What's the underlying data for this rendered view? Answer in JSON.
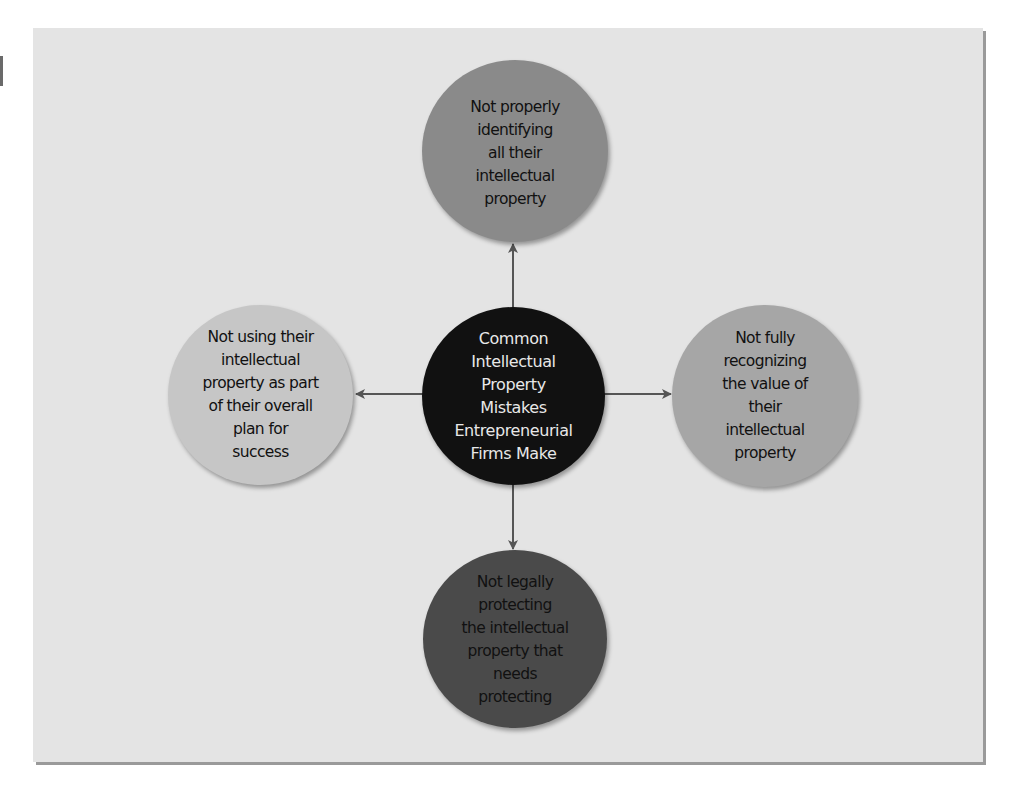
{
  "diagram": {
    "type": "hub-and-spoke",
    "colors": {
      "background": "#ffffff",
      "frame_fill": "#e4e4e4",
      "frame_shadow": "#9a9a9a",
      "arrow": "#555555"
    },
    "center": {
      "label": "Common\nIntellectual\nProperty\nMistakes\nEntrepreneurial\nFirms Make",
      "fill": "#111111",
      "text_color": "#e8e8e8"
    },
    "spokes": [
      {
        "position": "top",
        "label": "Not properly\nidentifying\nall their\nintellectual\nproperty",
        "fill": "#8a8a8a",
        "text_color": "#111111"
      },
      {
        "position": "left",
        "label": "Not using their\nintellectual\nproperty as part\nof their overall\nplan for\nsuccess",
        "fill": "#c6c6c6",
        "text_color": "#111111"
      },
      {
        "position": "right",
        "label": "Not fully\nrecognizing\nthe value of\ntheir\nintellectual\nproperty",
        "fill": "#a6a6a6",
        "text_color": "#111111"
      },
      {
        "position": "bottom",
        "label": "Not legally\nprotecting\nthe intellectual\nproperty that\nneeds\nprotecting",
        "fill": "#4a4a4a",
        "text_color": "#111111"
      }
    ],
    "arrows": [
      {
        "from": "center",
        "to": "top"
      },
      {
        "from": "center",
        "to": "left"
      },
      {
        "from": "center",
        "to": "right"
      },
      {
        "from": "center",
        "to": "bottom"
      }
    ]
  }
}
